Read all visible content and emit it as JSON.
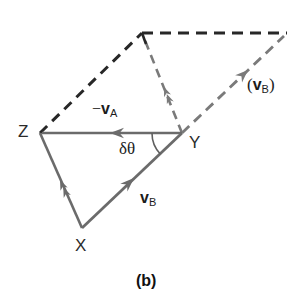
{
  "figure": {
    "caption": "(b)",
    "colors": {
      "solid_stroke": "#6b6b6b",
      "dashed_stroke": "#272727",
      "dashed_light_stroke": "#7a7a7a",
      "text": "#1c1c1c",
      "background": "#ffffff"
    },
    "vertices": [
      {
        "id": "Z",
        "label": "Z",
        "x": 40,
        "y": 133
      },
      {
        "id": "Y",
        "label": "Y",
        "x": 182,
        "y": 133
      },
      {
        "id": "X",
        "label": "X",
        "x": 82,
        "y": 228
      },
      {
        "id": "T",
        "label": "",
        "x": 142,
        "y": 33
      },
      {
        "id": "U",
        "label": "",
        "x": 287,
        "y": 33
      }
    ],
    "vectors": [
      {
        "name": "minus-v-a",
        "label": "−",
        "symbol": "v",
        "subscript": "A",
        "from": "Z",
        "to": "Y",
        "direction": "Y-to-Z",
        "style": "solid",
        "arrowheads": 1
      },
      {
        "name": "v-b-lower",
        "label": "",
        "symbol": "v",
        "subscript": "B",
        "from": "X",
        "to": "Y",
        "direction": "X-to-Y",
        "style": "solid",
        "arrowheads": 1
      },
      {
        "name": "v-a-left",
        "label": "",
        "symbol": "",
        "subscript": "",
        "from": "X",
        "to": "Z",
        "direction": "X-to-Z",
        "style": "solid",
        "arrowheads": 2
      },
      {
        "name": "v-b-parenthetical",
        "label": "(",
        "symbol": "v",
        "subscript": "B",
        "closing": ")",
        "from": "Y",
        "to": "U",
        "direction": "Y-to-U",
        "style": "dashed-light",
        "arrowheads": 1
      },
      {
        "name": "v-a-vertical-dashed",
        "label": "",
        "symbol": "",
        "subscript": "",
        "from": "Y",
        "to": "T",
        "direction": "Y-to-T",
        "style": "dashed-light",
        "arrowheads": 2
      },
      {
        "name": "z-to-top-dashed",
        "label": "",
        "symbol": "",
        "subscript": "",
        "from": "Z",
        "to": "T",
        "style": "dashed-dark",
        "arrowheads": 0
      },
      {
        "name": "top-horizontal-dashed",
        "label": "",
        "symbol": "",
        "subscript": "",
        "from": "T",
        "to": "U",
        "style": "dashed-dark",
        "arrowheads": 0
      }
    ],
    "labels": {
      "minus_v_a": {
        "prefix": "−",
        "symbol": "v",
        "sub": "A"
      },
      "v_b": {
        "prefix": "",
        "symbol": "v",
        "sub": "B"
      },
      "v_b_paren": {
        "open": "(",
        "symbol": "v",
        "sub": "B",
        "close": ")"
      },
      "delta_theta": "δθ",
      "vertex_z": "Z",
      "vertex_y": "Y",
      "vertex_x": "X"
    },
    "angle_arc": {
      "name": "delta-theta-arc",
      "vertex": "Y",
      "radius": 30,
      "text": "δθ"
    }
  }
}
